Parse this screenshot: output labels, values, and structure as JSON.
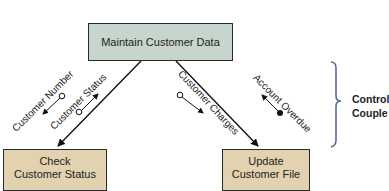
{
  "diagram": {
    "type": "structure-chart",
    "modules": {
      "top": {
        "label": "Maintain Customer Data",
        "color": "#c7d6cd"
      },
      "left": {
        "line1": "Check",
        "line2": "Customer Status",
        "color": "#e2d2b0"
      },
      "right": {
        "line1": "Update",
        "line2": "Customer File",
        "color": "#e2d2b0"
      }
    },
    "couples": [
      {
        "label": "Customer Number",
        "kind": "data",
        "symbol": "open-circle",
        "direction": "down-left"
      },
      {
        "label": "Customer Status",
        "kind": "data",
        "symbol": "open-circle",
        "direction": "up-right"
      },
      {
        "label": "Customer Charges",
        "kind": "data",
        "symbol": "open-circle",
        "direction": "down-right"
      },
      {
        "label": "Account Overdue",
        "kind": "control",
        "symbol": "filled-circle",
        "direction": "up-left"
      }
    ],
    "legend": {
      "line1": "Control",
      "line2": "Couple",
      "bracket_color": "#5a6a9a"
    }
  }
}
